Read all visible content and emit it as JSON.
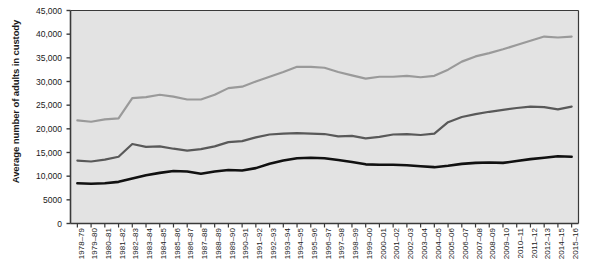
{
  "chart_data": {
    "type": "line",
    "title": "",
    "xlabel": "",
    "ylabel": "Average number of adults in custody",
    "ylim": [
      0,
      45000
    ],
    "yticks": [
      0,
      5000,
      10000,
      15000,
      20000,
      25000,
      30000,
      35000,
      40000,
      45000
    ],
    "ytick_labels": [
      "0",
      "5000",
      "10,000",
      "15,000",
      "20,000",
      "25,000",
      "30,000",
      "35,000",
      "40,000",
      "45,000"
    ],
    "grid": false,
    "legend": "none",
    "plot_background": "#e3e3e3",
    "categories": [
      "1978–79",
      "1979–80",
      "1980–81",
      "1981–82",
      "1982–83",
      "1983–84",
      "1984–85",
      "1985–86",
      "1986–87",
      "1987–88",
      "1988–89",
      "1989–90",
      "1990–91",
      "1991–92",
      "1992–93",
      "1993–94",
      "1994–95",
      "1995–96",
      "1996–97",
      "1997–98",
      "1998–99",
      "1999–00",
      "2000–01",
      "2001–02",
      "2002–03",
      "2003–04",
      "2004–05",
      "2005–06",
      "2006–07",
      "2007–08",
      "2008–09",
      "2009–10",
      "2010–11",
      "2011–12",
      "2012–13",
      "2014–15",
      "2015–16"
    ],
    "series": [
      {
        "name": "upper-series",
        "color": "#9a9a9a",
        "width": 2.2,
        "values": [
          21800,
          21500,
          22000,
          22200,
          26500,
          26700,
          27200,
          26800,
          26200,
          26200,
          27200,
          28600,
          28900,
          30000,
          31000,
          32000,
          33100,
          33100,
          32900,
          32000,
          31300,
          30600,
          31000,
          31000,
          31200,
          30900,
          31200,
          32500,
          34200,
          35300,
          36000,
          36800,
          37700,
          38600,
          39500,
          39300,
          39500
        ]
      },
      {
        "name": "middle-series",
        "color": "#595959",
        "width": 2.2,
        "values": [
          13300,
          13100,
          13500,
          14100,
          16800,
          16200,
          16300,
          15800,
          15400,
          15700,
          16300,
          17200,
          17400,
          18200,
          18800,
          19000,
          19100,
          19000,
          18900,
          18400,
          18500,
          18000,
          18300,
          18800,
          18900,
          18700,
          19000,
          21400,
          22500,
          23100,
          23600,
          24000,
          24400,
          24700,
          24600,
          24100,
          24700
        ]
      },
      {
        "name": "lower-series",
        "color": "#111111",
        "width": 2.6,
        "values": [
          8500,
          8400,
          8500,
          8800,
          9500,
          10200,
          10700,
          11100,
          11000,
          10500,
          11000,
          11300,
          11200,
          11700,
          12600,
          13300,
          13800,
          13900,
          13800,
          13400,
          13000,
          12500,
          12400,
          12400,
          12300,
          12100,
          11900,
          12200,
          12600,
          12800,
          12900,
          12800,
          13200,
          13600,
          13900,
          14200,
          14100
        ]
      }
    ]
  }
}
